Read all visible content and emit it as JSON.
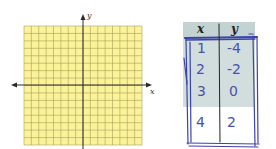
{
  "graph": {
    "x_label": "x",
    "y_label": "y",
    "grid_range": {
      "x": [
        -8,
        8
      ],
      "y": [
        -8,
        8
      ]
    },
    "colors": {
      "fill": "#fbf29a",
      "grid": "#a9a159",
      "axis": "#2a2a2a"
    }
  },
  "table": {
    "headers": {
      "x": "x",
      "y": "y"
    },
    "rows": [
      {
        "x": "1",
        "y": "-4"
      },
      {
        "x": "2",
        "y": "-2"
      },
      {
        "x": "3",
        "y": "0"
      },
      {
        "x": "4",
        "y": "2"
      }
    ],
    "ink_color": "#3c44a6"
  }
}
